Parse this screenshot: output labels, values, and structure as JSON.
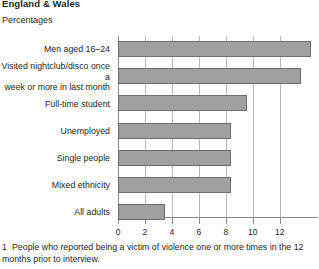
{
  "header": {
    "region_title": "England & Wales",
    "units_label": "Percentages"
  },
  "footnote": {
    "number": "1",
    "text": "People who reported being a victim of violence one or more times in the 12 months prior to interview."
  },
  "colors": {
    "bar_fill": "#a0a0a0",
    "bar_border": "#6e6e6e",
    "gridline": "#b7b7b7",
    "axis": "#8a8a8a",
    "text": "#231f20"
  },
  "chart_data": {
    "type": "bar",
    "orientation": "horizontal",
    "title": "England & Wales",
    "subtitle": "Percentages",
    "xlabel": "",
    "ylabel": "",
    "xlim": [
      0,
      14.4
    ],
    "xticks": [
      0,
      2,
      4,
      6,
      8,
      10,
      12
    ],
    "xtick_labels": [
      "0",
      "2",
      "4",
      "6",
      "8",
      "10",
      "12"
    ],
    "grid": true,
    "legend": false,
    "categories": [
      "Men aged 16–24",
      "Visited nightclub/disco once a week or more in last month",
      "Full-time student",
      "Unemployed",
      "Single people",
      "Mixed ethnicity",
      "All adults"
    ],
    "category_lines": [
      [
        "Men aged 16–24"
      ],
      [
        "Visited nightclub/disco once a",
        "week or more in last month"
      ],
      [
        "Full-time student"
      ],
      [
        "Unemployed"
      ],
      [
        "Single people"
      ],
      [
        "Mixed ethnicity"
      ],
      [
        "All adults"
      ]
    ],
    "values": [
      14.3,
      13.6,
      9.6,
      8.4,
      8.4,
      8.4,
      3.5
    ]
  }
}
